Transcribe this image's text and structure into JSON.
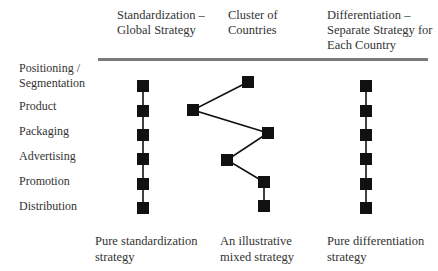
{
  "columns": [
    {
      "header_line1": "Standardization –",
      "header_line2": "Global Strategy",
      "header_line3": "",
      "footer_line1": "Pure standardization",
      "footer_line2": "strategy"
    },
    {
      "header_line1": "Cluster of",
      "header_line2": "Countries",
      "header_line3": "",
      "footer_line1": "An illustrative",
      "footer_line2": "mixed strategy"
    },
    {
      "header_line1": "Differentiation –",
      "header_line2": "Separate Strategy for",
      "header_line3": "Each Country",
      "footer_line1": "Pure differentiation",
      "footer_line2": "strategy"
    }
  ],
  "rows": [
    {
      "label_line1": "Positioning /",
      "label_line2": "Segmentation"
    },
    {
      "label_line1": "Product",
      "label_line2": ""
    },
    {
      "label_line1": "Packaging",
      "label_line2": ""
    },
    {
      "label_line1": "Advertising",
      "label_line2": ""
    },
    {
      "label_line1": "Promotion",
      "label_line2": ""
    },
    {
      "label_line1": "Distribution",
      "label_line2": ""
    }
  ],
  "marker_color": "#111111",
  "rule_color": "#7a7a7a",
  "series": {
    "standardization": {
      "name": "Pure standardization strategy",
      "points": [
        [
          143,
          86
        ],
        [
          143,
          111
        ],
        [
          143,
          135
        ],
        [
          143,
          159
        ],
        [
          143,
          184
        ],
        [
          143,
          208
        ]
      ]
    },
    "mixed": {
      "name": "An illustrative mixed strategy",
      "points": [
        [
          248,
          82
        ],
        [
          193,
          110
        ],
        [
          268,
          133
        ],
        [
          227,
          160
        ],
        [
          264,
          182
        ],
        [
          264,
          206
        ]
      ]
    },
    "differentiation": {
      "name": "Pure differentiation strategy",
      "points": [
        [
          366,
          86
        ],
        [
          366,
          111
        ],
        [
          366,
          135
        ],
        [
          366,
          159
        ],
        [
          366,
          184
        ],
        [
          366,
          208
        ]
      ]
    }
  }
}
